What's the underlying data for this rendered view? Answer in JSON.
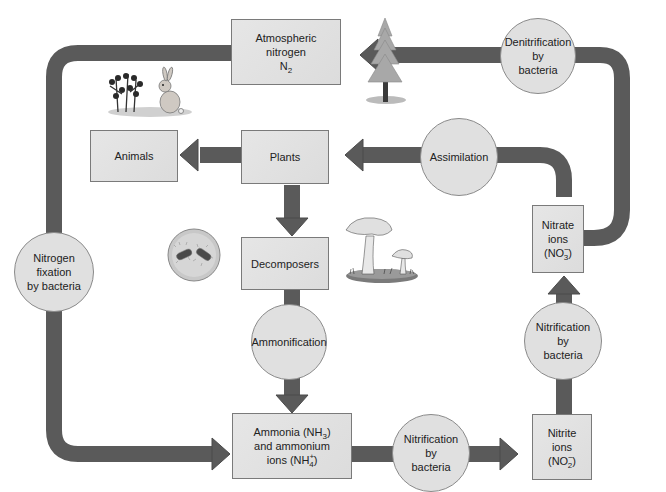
{
  "colors": {
    "arrow": "#5a5a5a",
    "box_fill": "#e2e2e2",
    "circle_fill": "#e0e0e0",
    "border": "#7a7a7a"
  },
  "boxes": {
    "atmospheric": {
      "line1": "Atmospheric",
      "line2": "nitrogen",
      "formula_base": "N",
      "formula_sub": "2"
    },
    "animals": {
      "label": "Animals"
    },
    "plants": {
      "label": "Plants"
    },
    "decomposers": {
      "label": "Decomposers"
    },
    "ammonia": {
      "line1_pre": "Ammonia (NH",
      "line1_sub": "3",
      "line1_post": ")",
      "line2": "and ammonium",
      "line3_pre": "ions (NH",
      "line3_sup": "+",
      "line3_sub": "4",
      "line3_post": ")"
    },
    "nitrite": {
      "line1": "Nitrite",
      "line2": "ions",
      "line3_pre": "(NO",
      "line3_sup": "−",
      "line3_sub": "2",
      "line3_post": ")"
    },
    "nitrate": {
      "line1": "Nitrate",
      "line2": "ions",
      "line3_pre": "(NO",
      "line3_sup": "−",
      "line3_sub": "3",
      "line3_post": ")"
    }
  },
  "processes": {
    "denitrification": {
      "line1": "Denitrification",
      "line2": "by",
      "line3": "bacteria"
    },
    "assimilation": {
      "label": "Assimilation"
    },
    "fixation": {
      "line1": "Nitrogen",
      "line2": "fixation",
      "line3": "by bacteria"
    },
    "ammonification": {
      "label": "Ammonification"
    },
    "nitrification_bottom": {
      "line1": "Nitrification",
      "line2": "by",
      "line3": "bacteria"
    },
    "nitrification_right": {
      "line1": "Nitrification",
      "line2": "by",
      "line3": "bacteria"
    }
  },
  "illustrations": [
    "plants-and-rabbit",
    "conifer-tree",
    "bacteria-in-petri-dish",
    "mushrooms"
  ]
}
